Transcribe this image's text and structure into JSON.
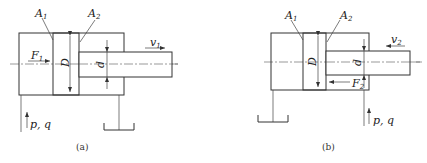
{
  "figure": {
    "diagram_a": {
      "caption": "(a)",
      "labels": {
        "area1": "A",
        "area1_sub": "1",
        "area2": "A",
        "area2_sub": "2",
        "force": "F",
        "force_sub": "1",
        "velocity": "v",
        "velocity_sub": "1",
        "bore": "D",
        "rod": "d",
        "supply": "p, q"
      },
      "force_direction": "right",
      "velocity_direction": "right",
      "supply_port": "cap-end (left)",
      "tank_port": "rod-end (right)"
    },
    "diagram_b": {
      "caption": "(b)",
      "labels": {
        "area1": "A",
        "area1_sub": "1",
        "area2": "A",
        "area2_sub": "2",
        "force": "F",
        "force_sub": "2",
        "velocity": "v",
        "velocity_sub": "2",
        "bore": "D",
        "rod": "d",
        "supply": "p, q"
      },
      "force_direction": "left",
      "velocity_direction": "left",
      "supply_port": "rod-end (right)",
      "tank_port": "cap-end (left)"
    },
    "colors": {
      "line": "#333333",
      "background": "#ffffff"
    }
  }
}
